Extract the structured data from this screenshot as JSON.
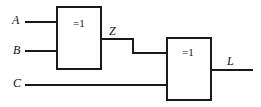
{
  "diagram": {
    "type": "logic-circuit-schematic",
    "colors": {
      "background": "#ffffff",
      "stroke": "#1a1a1a",
      "text": "#111111"
    },
    "stroke_width": 2,
    "inputs": [
      {
        "id": "A",
        "label": "A",
        "wire_y": 22
      },
      {
        "id": "B",
        "label": "B",
        "wire_y": 51
      },
      {
        "id": "C",
        "label": "C",
        "wire_y": 85
      }
    ],
    "gates": [
      {
        "id": "gate1",
        "label": "=1",
        "symbol_meaning": "exclusive-or",
        "x": 57,
        "y": 7,
        "width": 44,
        "height": 62,
        "inputs": [
          "A",
          "B"
        ],
        "output": "Z"
      },
      {
        "id": "gate2",
        "label": "=1",
        "symbol_meaning": "exclusive-or",
        "x": 167,
        "y": 38,
        "width": 44,
        "height": 62,
        "inputs": [
          "Z",
          "C"
        ],
        "output": "L"
      }
    ],
    "nets": [
      {
        "id": "Z",
        "label": "Z",
        "from": "gate1",
        "to": "gate2"
      },
      {
        "id": "L",
        "label": "L",
        "from": "gate2",
        "to": "output"
      }
    ],
    "outputs": [
      {
        "id": "L",
        "label": "L",
        "wire_y": 70
      }
    ]
  }
}
